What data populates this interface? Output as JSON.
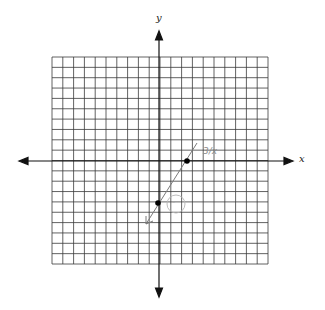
{
  "figure": {
    "type": "coordinate-plane",
    "grid": {
      "columns": 20,
      "rows": 20,
      "left": 52,
      "top": 57,
      "right": 268,
      "bottom": 264,
      "line_color": "#3a3a3a"
    },
    "origin_px": {
      "x": 159,
      "y": 161
    },
    "axes": {
      "x_label": "x",
      "y_label": "y",
      "color": "#111111"
    },
    "points": [
      {
        "label": "x-intercept",
        "coords": [
          3,
          0
        ],
        "px": [
          187,
          161
        ]
      },
      {
        "label": "y-intercept",
        "coords": [
          0,
          -4
        ],
        "px": [
          158,
          203
        ]
      }
    ],
    "line": {
      "description": "hand-drawn line through points with arrow at lower end",
      "start_px": [
        197,
        143
      ],
      "end_px": [
        146,
        224
      ],
      "color": "#7a7a7a"
    },
    "annotations": [
      {
        "text": "3/x",
        "px": [
          202,
          152
        ],
        "color": "#8a8a8a"
      },
      {
        "text": "-",
        "shape": "circle",
        "px": [
          174,
          204
        ],
        "color": "#b0b0b0"
      }
    ]
  }
}
